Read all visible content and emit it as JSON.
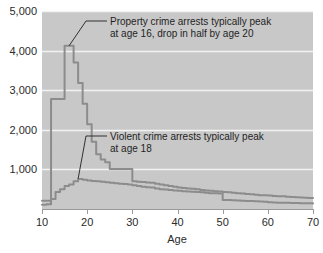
{
  "chart_data": {
    "type": "line",
    "title": "",
    "xlabel": "Age",
    "ylabel": "",
    "xlim": [
      10,
      70
    ],
    "ylim": [
      0,
      5000
    ],
    "grid": true,
    "legend_position": "none",
    "xticks": [
      "10",
      "20",
      "30",
      "40",
      "50",
      "60",
      "70"
    ],
    "xtick_values": [
      10,
      20,
      30,
      40,
      50,
      60,
      70
    ],
    "yticks": [
      "1,000",
      "2,000",
      "3,000",
      "4,000",
      "5,000"
    ],
    "ytick_values": [
      1000,
      2000,
      3000,
      4000,
      5000
    ],
    "x": [
      10,
      11,
      12,
      13,
      14,
      15,
      16,
      17,
      18,
      19,
      20,
      21,
      22,
      23,
      24,
      25,
      26,
      27,
      28,
      29,
      30,
      31,
      32,
      33,
      34,
      35,
      36,
      37,
      38,
      39,
      40,
      41,
      42,
      43,
      44,
      45,
      46,
      47,
      48,
      49,
      50,
      51,
      52,
      53,
      54,
      55,
      56,
      57,
      58,
      59,
      60,
      61,
      62,
      63,
      64,
      65,
      66,
      67,
      68,
      69,
      70
    ],
    "series": [
      {
        "name": "Property crime arrests",
        "color": "#8c8c8c",
        "values": [
          210,
          210,
          2780,
          2780,
          2780,
          4120,
          4120,
          3700,
          3180,
          2660,
          2140,
          1700,
          1380,
          1250,
          1180,
          1010,
          1010,
          1010,
          1010,
          1010,
          700,
          690,
          680,
          670,
          660,
          640,
          620,
          600,
          580,
          560,
          540,
          530,
          520,
          510,
          500,
          480,
          470,
          460,
          450,
          440,
          430,
          420,
          410,
          400,
          390,
          380,
          370,
          360,
          350,
          345,
          340,
          330,
          325,
          320,
          310,
          300,
          295,
          290,
          285,
          280,
          275
        ]
      },
      {
        "name": "Violent crime arrests",
        "color": "#8c8c8c",
        "values": [
          110,
          120,
          250,
          430,
          500,
          580,
          620,
          700,
          760,
          740,
          720,
          710,
          700,
          690,
          675,
          660,
          650,
          640,
          630,
          620,
          600,
          580,
          565,
          550,
          540,
          520,
          500,
          490,
          480,
          470,
          460,
          450,
          440,
          435,
          430,
          420,
          410,
          400,
          395,
          390,
          230,
          225,
          220,
          215,
          210,
          205,
          200,
          195,
          190,
          185,
          170,
          165,
          160,
          158,
          155,
          152,
          150,
          148,
          146,
          144,
          142
        ]
      }
    ],
    "annotations": [
      {
        "id": "property-annotation",
        "lines": [
          "Property crime arrests typically peak",
          "at age 16, drop in half by age 20"
        ],
        "target_x": 16,
        "target_y": 4120
      },
      {
        "id": "violent-annotation",
        "lines": [
          "Violent crime arrests typically peak",
          "at age 18"
        ],
        "target_x": 18,
        "target_y": 760
      }
    ],
    "colors": {
      "plot_background": "#c8c8c8",
      "gridline": "#f2f2f2",
      "line": "#8c8c8c",
      "text": "#2b2b2b",
      "page_background": "#ffffff"
    }
  }
}
